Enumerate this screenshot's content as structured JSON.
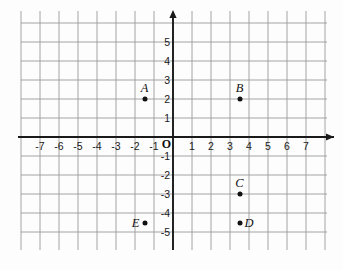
{
  "chart_data": {
    "type": "scatter",
    "title": "",
    "xlabel": "",
    "ylabel": "",
    "xlim": [
      -7.8,
      7.8
    ],
    "ylim": [
      -5.8,
      5.8
    ],
    "grid": true,
    "legend": "none",
    "origin_label": "O",
    "xticks": [
      -7,
      -6,
      -5,
      -4,
      -3,
      -2,
      -1,
      1,
      2,
      3,
      4,
      5,
      6,
      7
    ],
    "xtick_labels": [
      "-7",
      "-6",
      "-5",
      "-4",
      "-3",
      "-2",
      "-1",
      "1",
      "2",
      "3",
      "4",
      "5",
      "6",
      "7"
    ],
    "yticks": [
      5,
      4,
      3,
      2,
      1,
      -1,
      -2,
      -3,
      -4,
      -5
    ],
    "ytick_labels": [
      "5",
      "4",
      "3",
      "2",
      "1",
      "-1",
      "-2",
      "-3",
      "-4",
      "-5"
    ],
    "points": [
      {
        "label": "A",
        "x": -1.5,
        "y": 2,
        "label_pos": "above"
      },
      {
        "label": "B",
        "x": 3.5,
        "y": 2,
        "label_pos": "above"
      },
      {
        "label": "C",
        "x": 3.5,
        "y": -3,
        "label_pos": "above"
      },
      {
        "label": "D",
        "x": 3.5,
        "y": -4.5,
        "label_pos": "right"
      },
      {
        "label": "E",
        "x": -1.5,
        "y": -4.5,
        "label_pos": "left"
      }
    ],
    "colors": {
      "grid": "#9a9a9a",
      "axis": "#1a1a1a",
      "point": "#111111",
      "background": "#fdfdfd"
    }
  }
}
